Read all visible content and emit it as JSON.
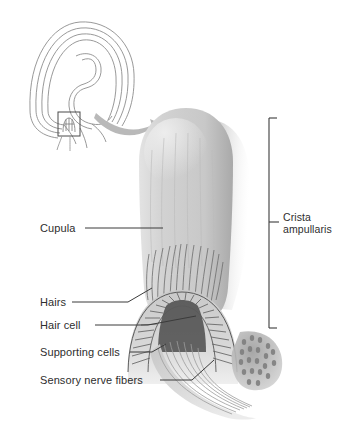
{
  "figure": {
    "background_color": "#ffffff",
    "ink_color": "#2e2e2e",
    "structure_fill": "#cdcdcd",
    "shadow_color": "#9a9a9a"
  },
  "inset": {
    "name": "semicircular-canal-outline",
    "description": "Line drawing of a semicircular canal loop with the ampulla boxed",
    "callout_arrow": "curved-arrow-right"
  },
  "labels": {
    "left": [
      {
        "id": "cupula",
        "text": "Cupula",
        "x": 40,
        "y": 222,
        "leader_to_x": 163,
        "leader_to_y": 228
      },
      {
        "id": "hairs",
        "text": "Hairs",
        "x": 40,
        "y": 296,
        "leader_to_x": 178,
        "leader_to_y": 286
      },
      {
        "id": "hair-cell",
        "text": "Hair cell",
        "x": 40,
        "y": 319,
        "leader_to_x": 196,
        "leader_to_y": 316
      },
      {
        "id": "supporting-cells",
        "text": "Supporting cells",
        "x": 40,
        "y": 346,
        "leader_to_x": 170,
        "leader_to_y": 350
      },
      {
        "id": "sensory-nerve-fibers",
        "text": "Sensory nerve fibers",
        "x": 40,
        "y": 374,
        "leader_to_x": 210,
        "leader_to_y": 366
      }
    ],
    "right": [
      {
        "id": "crista-ampullaris",
        "line1": "Crista",
        "line2": "ampullaris",
        "x": 283,
        "y": 212,
        "bracket": {
          "x": 269,
          "top": 118,
          "bottom": 328,
          "tick": 8
        }
      }
    ]
  }
}
